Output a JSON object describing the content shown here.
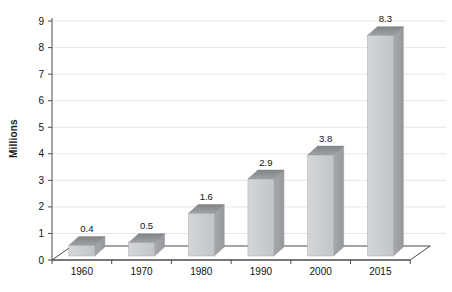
{
  "chart_data": {
    "type": "bar",
    "style": "3d-column",
    "title": "",
    "xlabel": "",
    "ylabel": "Millions",
    "categories": [
      "1960",
      "1970",
      "1980",
      "1990",
      "2000",
      "2015"
    ],
    "values": [
      0.4,
      0.5,
      1.6,
      2.9,
      3.8,
      8.3
    ],
    "data_labels": [
      "0.4",
      "0.5",
      "1.6",
      "2.9",
      "3.8",
      "8.3"
    ],
    "ylim": [
      0,
      9
    ],
    "ytick_interval": 1,
    "yticks": [
      "0",
      "1",
      "2",
      "3",
      "4",
      "5",
      "6",
      "7",
      "8",
      "9"
    ],
    "grid": "horizontal",
    "legend": "none",
    "colors": {
      "background": "#ffffff",
      "gridline": "#e6e6e7",
      "axis": "#4a4a4c",
      "bar_front_light": "#d4d6d8",
      "bar_front_dark": "#c2c4c7",
      "bar_side_light": "#a6a8ab",
      "bar_side_dark": "#96989b",
      "bar_top_dark": "#828588",
      "bar_top_light": "#9fa1a4",
      "text": "#111111"
    }
  }
}
